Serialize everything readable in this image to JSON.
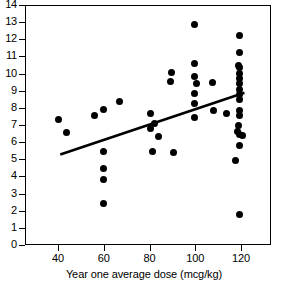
{
  "chart_data": {
    "type": "scatter",
    "title": "",
    "xlabel": "Year one average dose (mcg/kg)",
    "ylabel": "",
    "xlim": [
      28,
      135
    ],
    "ylim": [
      0,
      14
    ],
    "grid": false,
    "legend": null,
    "x_ticks": [
      40,
      60,
      80,
      100,
      120
    ],
    "y_ticks": [
      0,
      1,
      2,
      3,
      4,
      5,
      6,
      7,
      8,
      9,
      10,
      11,
      12,
      13,
      14
    ],
    "x_tick_labels": [
      "40",
      "60",
      "80",
      "100",
      "120"
    ],
    "y_tick_labels": [
      "0",
      "1",
      "2",
      "3",
      "4",
      "5",
      "6",
      "7",
      "8",
      "9",
      "10",
      "11",
      "12",
      "13",
      "14"
    ],
    "marker": "filled-circle",
    "marker_color": "#000000",
    "points": [
      {
        "x": 40.0,
        "y": 7.35
      },
      {
        "x": 43.5,
        "y": 6.55
      },
      {
        "x": 56.0,
        "y": 7.55
      },
      {
        "x": 60.0,
        "y": 7.9
      },
      {
        "x": 60.0,
        "y": 5.45
      },
      {
        "x": 60.0,
        "y": 4.45
      },
      {
        "x": 60.0,
        "y": 3.8
      },
      {
        "x": 60.0,
        "y": 2.4
      },
      {
        "x": 67.0,
        "y": 8.4
      },
      {
        "x": 80.5,
        "y": 7.65
      },
      {
        "x": 80.5,
        "y": 6.8
      },
      {
        "x": 82.0,
        "y": 7.1
      },
      {
        "x": 84.0,
        "y": 6.35
      },
      {
        "x": 81.5,
        "y": 5.48
      },
      {
        "x": 89.5,
        "y": 10.05
      },
      {
        "x": 89.0,
        "y": 9.55
      },
      {
        "x": 90.5,
        "y": 5.4
      },
      {
        "x": 99.5,
        "y": 12.85
      },
      {
        "x": 99.5,
        "y": 10.6
      },
      {
        "x": 99.5,
        "y": 9.85
      },
      {
        "x": 100.5,
        "y": 9.45
      },
      {
        "x": 99.5,
        "y": 8.85
      },
      {
        "x": 99.5,
        "y": 8.25
      },
      {
        "x": 99.5,
        "y": 7.45
      },
      {
        "x": 107.5,
        "y": 9.5
      },
      {
        "x": 108.0,
        "y": 7.85
      },
      {
        "x": 119.5,
        "y": 12.25
      },
      {
        "x": 119.5,
        "y": 11.25
      },
      {
        "x": 119.0,
        "y": 10.5
      },
      {
        "x": 119.5,
        "y": 10.35
      },
      {
        "x": 119.5,
        "y": 10.0
      },
      {
        "x": 119.5,
        "y": 9.7
      },
      {
        "x": 119.5,
        "y": 9.4
      },
      {
        "x": 119.5,
        "y": 9.1
      },
      {
        "x": 119.5,
        "y": 8.8
      },
      {
        "x": 119.5,
        "y": 8.5
      },
      {
        "x": 119.5,
        "y": 7.85
      },
      {
        "x": 119.5,
        "y": 7.55
      },
      {
        "x": 119.0,
        "y": 7.0
      },
      {
        "x": 118.5,
        "y": 6.6
      },
      {
        "x": 119.5,
        "y": 6.45
      },
      {
        "x": 120.5,
        "y": 6.4
      },
      {
        "x": 119.5,
        "y": 5.8
      },
      {
        "x": 117.5,
        "y": 4.95
      },
      {
        "x": 119.5,
        "y": 1.78
      },
      {
        "x": 113.5,
        "y": 7.7
      }
    ],
    "trend_line": {
      "x_start": 41.0,
      "y_start": 5.28,
      "x_end": 121.5,
      "y_end": 8.88,
      "color": "#000000",
      "width": 2.6
    }
  }
}
